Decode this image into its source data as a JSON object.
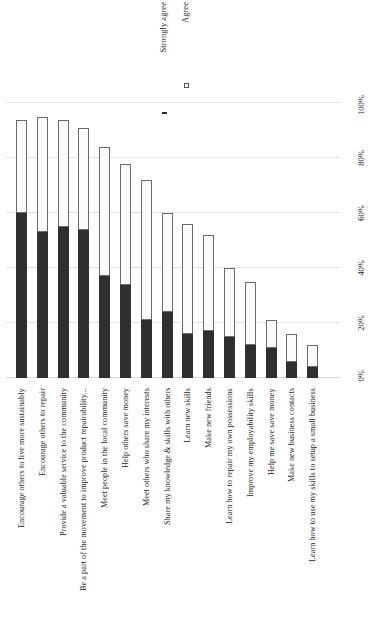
{
  "chart_data": {
    "type": "bar",
    "orientation": "vertical-stacked",
    "title": "",
    "xlabel": "",
    "ylabel": "",
    "ylim": [
      0,
      100
    ],
    "ytick_labels": [
      "0%",
      "20%",
      "40%",
      "60%",
      "80%",
      "100%"
    ],
    "ytick_values": [
      0,
      20,
      40,
      60,
      80,
      100
    ],
    "grid": true,
    "legend_position": "top-center",
    "categories": [
      "Encourage others to live more sustainably",
      "Encourage others to repair",
      "Provide a valuable service to the community",
      "Be a part of the movement to improve product repairability...",
      "Meet people in the local community",
      "Help others save money",
      "Meet others who share my interests",
      "Share my knowledge & skills with others",
      "Learn new skills",
      "Make new friends",
      "Learn how to repair my own possessions",
      "Improve my employability skills",
      "Help me save save money",
      "Make new business contacts",
      "Learn how to use my skills to setup a small business"
    ],
    "series": [
      {
        "name": "Strongly agree",
        "color": "#2f2f2f",
        "marker": "filled-square",
        "values": [
          60,
          53,
          55,
          54,
          37,
          34,
          21,
          24,
          16,
          17,
          15,
          12,
          11,
          6,
          4
        ]
      },
      {
        "name": "Agree",
        "color": "#fbfbfb",
        "marker": "hollow-square",
        "values": [
          34,
          42,
          39,
          37,
          47,
          44,
          51,
          36,
          40,
          35,
          25,
          23,
          10,
          10,
          8
        ]
      }
    ],
    "totals": [
      94,
      95,
      94,
      91,
      84,
      78,
      72,
      60,
      56,
      52,
      40,
      35,
      21,
      16,
      12
    ]
  }
}
